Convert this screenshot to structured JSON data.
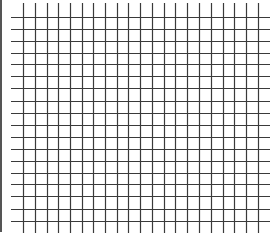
{
  "image": {
    "width": 277,
    "height": 236,
    "background": "#ffffff"
  },
  "left_border": {
    "x": 0,
    "width": 2,
    "y1": 0,
    "y2": 232,
    "color": "#555555"
  },
  "grid": {
    "line_color": "#3a3a3a",
    "line_width": 1.2,
    "horizontal_lines": {
      "count": 18,
      "y": [
        17,
        29,
        41,
        53,
        64,
        76,
        88,
        101,
        113,
        125,
        137,
        149,
        161,
        173,
        184,
        196,
        209,
        221
      ],
      "x1": 11,
      "x2": 270
    },
    "vertical_lines": {
      "count": 21,
      "x": [
        23,
        35,
        47,
        58,
        70,
        82,
        93,
        105,
        117,
        128,
        140,
        152,
        164,
        175,
        187,
        199,
        211,
        223,
        234,
        246,
        258
      ],
      "y1": 3,
      "y2": 233
    }
  }
}
